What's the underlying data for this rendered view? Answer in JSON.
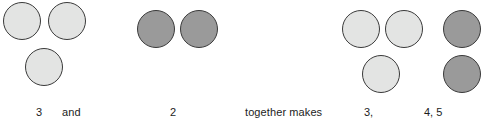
{
  "worksheet": {
    "type": "addition-counters-number-sentence",
    "background_color": "#ffffff",
    "counter_colors": {
      "light": "#e3e4e3",
      "dark": "#9a9a9a",
      "outline": "#3a3a3a"
    },
    "text_color": "#1c1c1c"
  },
  "groups": [
    {
      "id": "addend-1",
      "fill": "light",
      "count": 3,
      "label": "3",
      "circles": [
        {
          "x": 3,
          "y": 2,
          "size": 38
        },
        {
          "x": 48,
          "y": 2,
          "size": 38
        },
        {
          "x": 25,
          "y": 48,
          "size": 38
        }
      ],
      "label_x": 36,
      "label_y": 106
    },
    {
      "id": "addend-2",
      "fill": "dark",
      "count": 2,
      "label": "2",
      "circles": [
        {
          "x": 137,
          "y": 10,
          "size": 38
        },
        {
          "x": 180,
          "y": 10,
          "size": 38
        }
      ],
      "label_x": 170,
      "label_y": 106
    },
    {
      "id": "sum-light-part",
      "fill": "light",
      "count": 3,
      "label": "3,",
      "circles": [
        {
          "x": 342,
          "y": 10,
          "size": 38
        },
        {
          "x": 385,
          "y": 10,
          "size": 38
        },
        {
          "x": 362,
          "y": 55,
          "size": 38
        }
      ],
      "label_x": 364,
      "label_y": 106
    },
    {
      "id": "sum-dark-part",
      "fill": "dark",
      "count": 2,
      "label": "4, 5",
      "circles": [
        {
          "x": 443,
          "y": 10,
          "size": 38
        },
        {
          "x": 443,
          "y": 55,
          "size": 38
        }
      ],
      "label_x": 424,
      "label_y": 106
    }
  ],
  "connectors": [
    {
      "id": "and-word",
      "text": "and",
      "x": 62,
      "y": 106
    },
    {
      "id": "together-makes-word",
      "text": "together makes",
      "x": 245,
      "y": 106
    }
  ]
}
